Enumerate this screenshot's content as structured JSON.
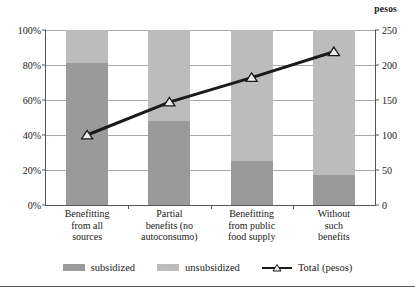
{
  "chart_data": {
    "type": "bar",
    "subtype": "stacked-bar-with-line-overlay",
    "title": "",
    "subtitle": "",
    "xlabel": "",
    "categories": [
      "Benefitting from all sources",
      "Partial benefits (no autoconsumo)",
      "Benefitting from public food supply",
      "Without such benefits"
    ],
    "category_lines": [
      [
        "Benefitting",
        "from all",
        "sources"
      ],
      [
        "Partial",
        "benefits (no",
        "autoconsumo)"
      ],
      [
        "Benefitting",
        "from public",
        "food supply"
      ],
      [
        "Without",
        "such",
        "benefits"
      ]
    ],
    "series": [
      {
        "name": "subsidized",
        "axis": "left",
        "unit": "%",
        "values": [
          81,
          48,
          25,
          17
        ],
        "color": "#9a9a9a"
      },
      {
        "name": "unsubsidized",
        "axis": "left",
        "unit": "%",
        "values": [
          19,
          52,
          75,
          83
        ],
        "color": "#bcbcbc"
      },
      {
        "name": "Total (pesos)",
        "axis": "right",
        "unit": "pesos",
        "values": [
          100,
          147,
          182,
          219
        ],
        "color": "#1a1a1a",
        "marker": "triangle"
      }
    ],
    "left_axis": {
      "label": "",
      "ylim": [
        0,
        100
      ],
      "ticks": [
        0,
        20,
        40,
        60,
        80,
        100
      ],
      "tick_labels": [
        "0%",
        "20%",
        "40%",
        "60%",
        "80%",
        "100%"
      ]
    },
    "right_axis": {
      "label": "pesos",
      "ylim": [
        0,
        250
      ],
      "ticks": [
        0,
        50,
        100,
        150,
        200,
        250
      ],
      "tick_labels": [
        "0",
        "50",
        "100",
        "150",
        "200",
        "250"
      ]
    },
    "grid": true,
    "legend_position": "bottom",
    "legend": [
      "subsidized",
      "unsubsidized",
      "Total (pesos)"
    ]
  },
  "colors": {
    "subsidized": "#9a9a9a",
    "unsubsidized": "#bcbcbc",
    "total_line": "#1a1a1a",
    "grid": "#a9a9a9",
    "axis": "#555555",
    "background": "#ffffff"
  }
}
